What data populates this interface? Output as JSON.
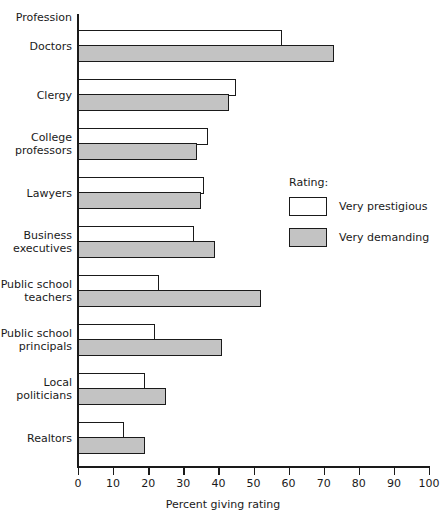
{
  "chart_data": {
    "type": "bar",
    "orientation": "horizontal",
    "title": "",
    "xlabel": "Percent giving rating",
    "ylabel": "Profession",
    "xlim": [
      0,
      100
    ],
    "xticks": [
      0,
      10,
      20,
      30,
      40,
      50,
      60,
      70,
      80,
      90,
      100
    ],
    "grid": false,
    "legend_title": "Rating:",
    "legend_position": "right-middle",
    "categories": [
      "Doctors",
      "Clergy",
      "College\nprofessors",
      "Lawyers",
      "Business\nexecutives",
      "Public school\nteachers",
      "Public school\nprincipals",
      "Local\npoliticians",
      "Realtors"
    ],
    "series": [
      {
        "name": "Very prestigious",
        "color": "#ffffff",
        "values": [
          58,
          45,
          37,
          36,
          33,
          23,
          22,
          19,
          13
        ]
      },
      {
        "name": "Very demanding",
        "color": "#c3c3c3",
        "values": [
          73,
          43,
          34,
          35,
          39,
          52,
          41,
          25,
          19
        ]
      }
    ]
  },
  "axis": {
    "category_header": "Profession",
    "value_title": "Percent giving rating",
    "tick_labels": [
      "0",
      "10",
      "20",
      "30",
      "40",
      "50",
      "60",
      "70",
      "80",
      "90",
      "100"
    ]
  },
  "legend": {
    "title": "Rating:",
    "entries": [
      {
        "label": "Very prestigious",
        "swatch": "white"
      },
      {
        "label": "Very demanding",
        "swatch": "gray"
      }
    ]
  },
  "colors": {
    "ink": "#1a1a1a",
    "bar_prestigious": "#ffffff",
    "bar_demanding": "#c3c3c3",
    "background": "#ffffff"
  }
}
